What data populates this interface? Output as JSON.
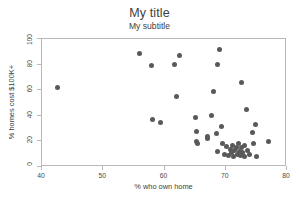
{
  "chart_data": {
    "type": "scatter",
    "title": "My title",
    "subtitle": "My subtitle",
    "xlabel": "% who own home",
    "ylabel": "% homes cost $100K+",
    "xlim": [
      40,
      80
    ],
    "ylim": [
      0,
      100
    ],
    "xticks": [
      40,
      50,
      60,
      70,
      80
    ],
    "yticks": [
      0,
      20,
      40,
      60,
      80,
      100
    ],
    "grid": false,
    "legend": null,
    "marker": {
      "shape": "circle",
      "color": "#595959",
      "size_px": 5
    },
    "frame_color": "#b9b9b9",
    "background": "#ffffff",
    "series": [
      {
        "name": "states",
        "points": [
          [
            42.5,
            62
          ],
          [
            55.9,
            89
          ],
          [
            57.8,
            79
          ],
          [
            58.0,
            37
          ],
          [
            59.4,
            35
          ],
          [
            61.7,
            80
          ],
          [
            62.4,
            87
          ],
          [
            62.0,
            55
          ],
          [
            65.1,
            39
          ],
          [
            65.3,
            28
          ],
          [
            65.3,
            20
          ],
          [
            65.4,
            18
          ],
          [
            67.0,
            24
          ],
          [
            67.1,
            22
          ],
          [
            67.6,
            40
          ],
          [
            68.0,
            59
          ],
          [
            68.6,
            80
          ],
          [
            69.0,
            92
          ],
          [
            68.5,
            26
          ],
          [
            68.6,
            12
          ],
          [
            69.3,
            32
          ],
          [
            69.5,
            18
          ],
          [
            69.8,
            10
          ],
          [
            70.2,
            16
          ],
          [
            70.4,
            9
          ],
          [
            70.7,
            14
          ],
          [
            70.9,
            11
          ],
          [
            71.1,
            17
          ],
          [
            71.3,
            8
          ],
          [
            71.5,
            13
          ],
          [
            71.7,
            15
          ],
          [
            71.9,
            10
          ],
          [
            72.0,
            18
          ],
          [
            72.2,
            12
          ],
          [
            72.4,
            9
          ],
          [
            72.6,
            15
          ],
          [
            72.8,
            11
          ],
          [
            73.0,
            17
          ],
          [
            73.1,
            8
          ],
          [
            72.5,
            66
          ],
          [
            73.4,
            45
          ],
          [
            73.5,
            13
          ],
          [
            73.8,
            10
          ],
          [
            74.3,
            27
          ],
          [
            74.6,
            18
          ],
          [
            74.9,
            33
          ],
          [
            75.0,
            8
          ],
          [
            77.0,
            20
          ]
        ]
      }
    ]
  }
}
